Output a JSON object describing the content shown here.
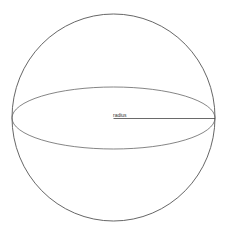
{
  "diagram": {
    "labels": {
      "radius": "radius"
    },
    "shapes": {
      "sphere_outline": {
        "cx": 113.5,
        "cy": 117.5,
        "rx": 101.5,
        "ry": 103.5,
        "stroke": "#555555"
      },
      "equator_ellipse": {
        "cx": 113.5,
        "cy": 118,
        "rx": 101.5,
        "ry": 31,
        "stroke": "#666666"
      },
      "radius_line": {
        "x1": 113.5,
        "y1": 118.5,
        "x2": 215,
        "y2": 118.5,
        "stroke": "#444444"
      }
    }
  }
}
